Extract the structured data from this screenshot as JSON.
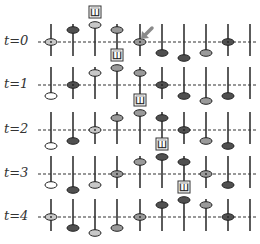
{
  "diagram": {
    "width": 260,
    "height": 244,
    "columns_x": [
      51,
      73,
      95,
      117,
      140,
      162,
      184,
      206,
      228,
      250
    ],
    "colors": {
      "white": "#ffffff",
      "light": "#c8c8c8",
      "mid": "#9a9a9a",
      "dark": "#505050",
      "line": "#333333",
      "arrow": "#8a8a8a"
    },
    "rows": [
      {
        "label": "t=0",
        "y": 42,
        "beads": [
          {
            "col": 0,
            "pos": "on",
            "fill": "light"
          },
          {
            "col": 1,
            "pos": "up",
            "fill": "dark"
          },
          {
            "col": 2,
            "pos": "up2",
            "fill": "light"
          },
          {
            "col": 3,
            "pos": "up",
            "fill": "mid"
          },
          {
            "col": 4,
            "pos": "on",
            "fill": "mid"
          },
          {
            "col": 5,
            "pos": "down",
            "fill": "dark"
          },
          {
            "col": 6,
            "pos": "down2",
            "fill": "dark"
          },
          {
            "col": 7,
            "pos": "down",
            "fill": "mid"
          },
          {
            "col": 8,
            "pos": "on",
            "fill": "dark"
          }
        ]
      },
      {
        "label": "t=1",
        "y": 85,
        "beads": [
          {
            "col": 0,
            "pos": "down",
            "fill": "white"
          },
          {
            "col": 1,
            "pos": "on",
            "fill": "dark"
          },
          {
            "col": 2,
            "pos": "up",
            "fill": "light"
          },
          {
            "col": 3,
            "pos": "up2",
            "fill": "mid"
          },
          {
            "col": 4,
            "pos": "up",
            "fill": "mid"
          },
          {
            "col": 5,
            "pos": "on",
            "fill": "dark"
          },
          {
            "col": 6,
            "pos": "down",
            "fill": "dark"
          },
          {
            "col": 7,
            "pos": "down2",
            "fill": "mid"
          },
          {
            "col": 8,
            "pos": "down",
            "fill": "dark"
          }
        ]
      },
      {
        "label": "t=2",
        "y": 130,
        "beads": [
          {
            "col": 0,
            "pos": "down2",
            "fill": "white"
          },
          {
            "col": 1,
            "pos": "down",
            "fill": "dark"
          },
          {
            "col": 2,
            "pos": "on",
            "fill": "light"
          },
          {
            "col": 3,
            "pos": "up",
            "fill": "mid"
          },
          {
            "col": 4,
            "pos": "up2",
            "fill": "mid"
          },
          {
            "col": 5,
            "pos": "up",
            "fill": "dark"
          },
          {
            "col": 6,
            "pos": "on",
            "fill": "dark"
          },
          {
            "col": 7,
            "pos": "down",
            "fill": "mid"
          },
          {
            "col": 8,
            "pos": "down2",
            "fill": "dark"
          }
        ]
      },
      {
        "label": "t=3",
        "y": 174,
        "beads": [
          {
            "col": 0,
            "pos": "down",
            "fill": "white"
          },
          {
            "col": 1,
            "pos": "down2",
            "fill": "dark"
          },
          {
            "col": 2,
            "pos": "down",
            "fill": "light"
          },
          {
            "col": 3,
            "pos": "on",
            "fill": "mid"
          },
          {
            "col": 4,
            "pos": "up",
            "fill": "mid"
          },
          {
            "col": 5,
            "pos": "up2",
            "fill": "dark"
          },
          {
            "col": 6,
            "pos": "up",
            "fill": "dark"
          },
          {
            "col": 7,
            "pos": "on",
            "fill": "mid"
          },
          {
            "col": 8,
            "pos": "down",
            "fill": "dark"
          }
        ]
      },
      {
        "label": "t=4",
        "y": 217,
        "beads": [
          {
            "col": 0,
            "pos": "on",
            "fill": "light"
          },
          {
            "col": 1,
            "pos": "down",
            "fill": "dark"
          },
          {
            "col": 2,
            "pos": "down2",
            "fill": "light"
          },
          {
            "col": 3,
            "pos": "down",
            "fill": "mid"
          },
          {
            "col": 4,
            "pos": "on",
            "fill": "mid"
          },
          {
            "col": 5,
            "pos": "up",
            "fill": "dark"
          },
          {
            "col": 6,
            "pos": "up2",
            "fill": "dark"
          },
          {
            "col": 7,
            "pos": "up",
            "fill": "mid"
          },
          {
            "col": 8,
            "pos": "on",
            "fill": "dark"
          }
        ]
      }
    ],
    "boxes": [
      {
        "col": 2,
        "row": 0,
        "glyph": "Ш"
      },
      {
        "col": 3,
        "row": 1,
        "glyph": "Ш"
      },
      {
        "col": 4,
        "row": 2,
        "glyph": "Ш"
      },
      {
        "col": 5,
        "row": 3,
        "glyph": "Ш"
      },
      {
        "col": 6,
        "row": 4,
        "glyph": "Ш"
      }
    ],
    "arrow": {
      "x1": 152,
      "y1": 28,
      "x2": 143,
      "y2": 37
    }
  }
}
